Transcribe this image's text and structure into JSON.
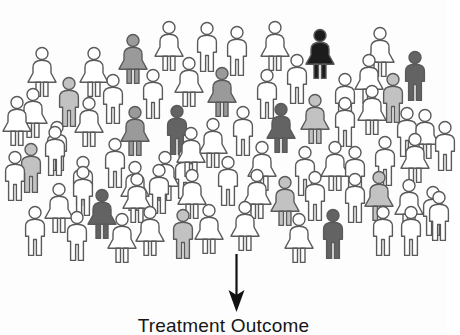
{
  "figure": {
    "type": "pictogram",
    "caption": "Treatment Outcome",
    "arrow": {
      "name": "downward-arrow",
      "direction": "down",
      "color": "#111111"
    },
    "background_color": "#ffffff",
    "outline_color": "#5a5a5a",
    "total_figures": 76,
    "shade_legend": [
      {
        "key": "white",
        "color": "#ffffff",
        "label": "no response",
        "count": 53
      },
      {
        "key": "light-gray",
        "color": "#c2c2c2",
        "label": "slight response",
        "count": 11
      },
      {
        "key": "mid-gray",
        "color": "#9a9a9a",
        "label": "partial response",
        "count": 5
      },
      {
        "key": "dark-gray",
        "color": "#636363",
        "label": "strong response",
        "count": 6
      },
      {
        "key": "black",
        "color": "#1c1c1c",
        "label": "full response",
        "count": 1
      }
    ],
    "figures": [
      {
        "sex": "female",
        "shade": "white",
        "x": 25,
        "y": 46,
        "s": 1.0
      },
      {
        "sex": "male",
        "shade": "light-gray",
        "x": 54,
        "y": 76,
        "s": 1.0
      },
      {
        "sex": "female",
        "shade": "white",
        "x": 77,
        "y": 46,
        "s": 1.0
      },
      {
        "sex": "female",
        "shade": "mid-gray",
        "x": 116,
        "y": 33,
        "s": 1.0
      },
      {
        "sex": "female",
        "shade": "white",
        "x": 152,
        "y": 20,
        "s": 1.0
      },
      {
        "sex": "male",
        "shade": "white",
        "x": 192,
        "y": 21,
        "s": 1.0
      },
      {
        "sex": "male",
        "shade": "white",
        "x": 222,
        "y": 25,
        "s": 1.0
      },
      {
        "sex": "female",
        "shade": "white",
        "x": 258,
        "y": 20,
        "s": 1.0
      },
      {
        "sex": "female",
        "shade": "black",
        "x": 303,
        "y": 28,
        "s": 1.0
      },
      {
        "sex": "female",
        "shade": "white",
        "x": 363,
        "y": 26,
        "s": 1.0
      },
      {
        "sex": "male",
        "shade": "dark-gray",
        "x": 400,
        "y": 50,
        "s": 1.0
      },
      {
        "sex": "female",
        "shade": "white",
        "x": 16,
        "y": 87,
        "s": 1.0
      },
      {
        "sex": "female",
        "shade": "white",
        "x": 72,
        "y": 96,
        "s": 1.0
      },
      {
        "sex": "male",
        "shade": "white",
        "x": 98,
        "y": 73,
        "s": 1.0
      },
      {
        "sex": "male",
        "shade": "white",
        "x": 138,
        "y": 68,
        "s": 1.0
      },
      {
        "sex": "female",
        "shade": "white",
        "x": 172,
        "y": 56,
        "s": 1.0
      },
      {
        "sex": "female",
        "shade": "mid-gray",
        "x": 205,
        "y": 66,
        "s": 1.0
      },
      {
        "sex": "male",
        "shade": "white",
        "x": 252,
        "y": 68,
        "s": 1.0
      },
      {
        "sex": "male",
        "shade": "white",
        "x": 282,
        "y": 53,
        "s": 1.0
      },
      {
        "sex": "male",
        "shade": "white",
        "x": 330,
        "y": 72,
        "s": 1.0
      },
      {
        "sex": "female",
        "shade": "white",
        "x": 352,
        "y": 53,
        "s": 1.0
      },
      {
        "sex": "male",
        "shade": "light-gray",
        "x": 378,
        "y": 72,
        "s": 1.0
      },
      {
        "sex": "male",
        "shade": "white",
        "x": 42,
        "y": 120,
        "s": 1.0
      },
      {
        "sex": "female",
        "shade": "mid-gray",
        "x": 118,
        "y": 105,
        "s": 1.0
      },
      {
        "sex": "male",
        "shade": "dark-gray",
        "x": 162,
        "y": 104,
        "s": 1.0
      },
      {
        "sex": "female",
        "shade": "white",
        "x": 196,
        "y": 117,
        "s": 1.0
      },
      {
        "sex": "male",
        "shade": "white",
        "x": 228,
        "y": 105,
        "s": 1.0
      },
      {
        "sex": "female",
        "shade": "dark-gray",
        "x": 264,
        "y": 102,
        "s": 1.0
      },
      {
        "sex": "female",
        "shade": "light-gray",
        "x": 298,
        "y": 93,
        "s": 1.0
      },
      {
        "sex": "male",
        "shade": "white",
        "x": 330,
        "y": 96,
        "s": 1.0
      },
      {
        "sex": "female",
        "shade": "white",
        "x": 355,
        "y": 84,
        "s": 1.0
      },
      {
        "sex": "male",
        "shade": "white",
        "x": 392,
        "y": 106,
        "s": 1.0
      },
      {
        "sex": "female",
        "shade": "white",
        "x": 408,
        "y": 108,
        "s": 1.0
      },
      {
        "sex": "male",
        "shade": "light-gray",
        "x": 16,
        "y": 142,
        "s": 1.0
      },
      {
        "sex": "male",
        "shade": "white",
        "x": 40,
        "y": 125,
        "s": 1.0
      },
      {
        "sex": "male",
        "shade": "white",
        "x": 68,
        "y": 155,
        "s": 1.0
      },
      {
        "sex": "male",
        "shade": "white",
        "x": 100,
        "y": 137,
        "s": 1.0
      },
      {
        "sex": "female",
        "shade": "white",
        "x": 118,
        "y": 160,
        "s": 1.0
      },
      {
        "sex": "female",
        "shade": "white",
        "x": 148,
        "y": 150,
        "s": 1.0
      },
      {
        "sex": "male",
        "shade": "white",
        "x": 170,
        "y": 148,
        "s": 1.0
      },
      {
        "sex": "female",
        "shade": "white",
        "x": 174,
        "y": 126,
        "s": 1.0
      },
      {
        "sex": "male",
        "shade": "white",
        "x": 213,
        "y": 155,
        "s": 1.0
      },
      {
        "sex": "female",
        "shade": "white",
        "x": 245,
        "y": 140,
        "s": 1.0
      },
      {
        "sex": "male",
        "shade": "white",
        "x": 290,
        "y": 145,
        "s": 1.0
      },
      {
        "sex": "female",
        "shade": "white",
        "x": 318,
        "y": 140,
        "s": 1.0
      },
      {
        "sex": "male",
        "shade": "white",
        "x": 340,
        "y": 145,
        "s": 1.0
      },
      {
        "sex": "male",
        "shade": "white",
        "x": 370,
        "y": 135,
        "s": 1.0
      },
      {
        "sex": "female",
        "shade": "white",
        "x": 398,
        "y": 132,
        "s": 1.0
      },
      {
        "sex": "female",
        "shade": "white",
        "x": 42,
        "y": 182,
        "s": 1.0
      },
      {
        "sex": "male",
        "shade": "white",
        "x": 68,
        "y": 165,
        "s": 1.0
      },
      {
        "sex": "female",
        "shade": "dark-gray",
        "x": 85,
        "y": 188,
        "s": 1.0
      },
      {
        "sex": "female",
        "shade": "white",
        "x": 120,
        "y": 172,
        "s": 1.0
      },
      {
        "sex": "male",
        "shade": "white",
        "x": 144,
        "y": 163,
        "s": 1.0
      },
      {
        "sex": "female",
        "shade": "white",
        "x": 175,
        "y": 168,
        "s": 1.0
      },
      {
        "sex": "female",
        "shade": "white",
        "x": 240,
        "y": 168,
        "s": 1.0
      },
      {
        "sex": "female",
        "shade": "light-gray",
        "x": 268,
        "y": 175,
        "s": 1.0
      },
      {
        "sex": "male",
        "shade": "white",
        "x": 300,
        "y": 170,
        "s": 1.0
      },
      {
        "sex": "male",
        "shade": "white",
        "x": 340,
        "y": 172,
        "s": 1.0
      },
      {
        "sex": "female",
        "shade": "light-gray",
        "x": 362,
        "y": 170,
        "s": 1.0
      },
      {
        "sex": "female",
        "shade": "white",
        "x": 392,
        "y": 178,
        "s": 1.0
      },
      {
        "sex": "male",
        "shade": "white",
        "x": 418,
        "y": 185,
        "s": 1.0
      },
      {
        "sex": "male",
        "shade": "white",
        "x": 20,
        "y": 205,
        "s": 1.0
      },
      {
        "sex": "male",
        "shade": "white",
        "x": 62,
        "y": 210,
        "s": 1.0
      },
      {
        "sex": "female",
        "shade": "white",
        "x": 105,
        "y": 212,
        "s": 1.0
      },
      {
        "sex": "female",
        "shade": "white",
        "x": 133,
        "y": 205,
        "s": 1.0
      },
      {
        "sex": "male",
        "shade": "light-gray",
        "x": 168,
        "y": 208,
        "s": 1.0
      },
      {
        "sex": "female",
        "shade": "white",
        "x": 192,
        "y": 203,
        "s": 1.0
      },
      {
        "sex": "female",
        "shade": "white",
        "x": 228,
        "y": 200,
        "s": 1.0
      },
      {
        "sex": "female",
        "shade": "white",
        "x": 282,
        "y": 212,
        "s": 1.0
      },
      {
        "sex": "male",
        "shade": "dark-gray",
        "x": 318,
        "y": 208,
        "s": 1.0
      },
      {
        "sex": "male",
        "shade": "white",
        "x": 368,
        "y": 205,
        "s": 1.0
      },
      {
        "sex": "male",
        "shade": "white",
        "x": 396,
        "y": 205,
        "s": 1.0
      },
      {
        "sex": "male",
        "shade": "white",
        "x": 424,
        "y": 190,
        "s": 1.0
      },
      {
        "sex": "male",
        "shade": "white",
        "x": 0,
        "y": 150,
        "s": 1.0
      },
      {
        "sex": "female",
        "shade": "white",
        "x": 0,
        "y": 95,
        "s": 1.0
      },
      {
        "sex": "male",
        "shade": "white",
        "x": 430,
        "y": 120,
        "s": 1.0
      }
    ]
  }
}
